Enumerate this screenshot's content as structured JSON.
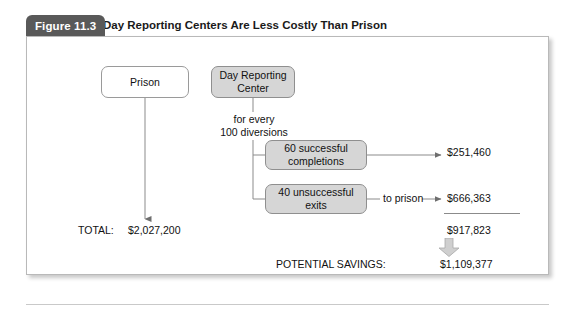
{
  "figure": {
    "tab_label": "Figure 11.3",
    "title": "Day Reporting Centers Are Less Costly Than Prison"
  },
  "nodes": {
    "prison": "Prison",
    "day_reporting_center": "Day Reporting\nCenter",
    "successful": "60 successful\ncompletions",
    "unsuccessful": "40 unsuccessful\nexits"
  },
  "labels": {
    "for_every_diversions": "for every\n100 diversions",
    "to_prison": "to prison",
    "total_label": "TOTAL:",
    "potential_savings_label": "POTENTIAL SAVINGS:"
  },
  "amounts": {
    "successful_cost": "$251,460",
    "unsuccessful_cost": "$666,363",
    "drc_subtotal": "$917,823",
    "prison_total": "$2,027,200",
    "potential_savings": "$1,109,377"
  },
  "colors": {
    "tab_background": "#595959",
    "node_gray_fill": "#d6d6d6",
    "node_border": "#9a9a9a",
    "connector": "#8b8b8b",
    "block_arrow_fill": "#cfcfcf",
    "frame_border": "#b9b9b9",
    "text": "#111111"
  },
  "chart_data": {
    "type": "diagram",
    "title": "Day Reporting Centers Are Less Costly Than Prison",
    "branches": [
      {
        "node": "Prison",
        "total": 2027200,
        "total_display": "$2,027,200"
      },
      {
        "node": "Day Reporting Center",
        "basis": "for every 100 diversions",
        "outcomes": [
          {
            "label": "60 successful completions",
            "count": 60,
            "cost": 251460,
            "cost_display": "$251,460"
          },
          {
            "label": "40 unsuccessful exits",
            "count": 40,
            "destination": "to prison",
            "cost": 666363,
            "cost_display": "$666,363"
          }
        ],
        "subtotal": 917823,
        "subtotal_display": "$917,823"
      }
    ],
    "potential_savings": 1109377,
    "potential_savings_display": "$1,109,377"
  }
}
